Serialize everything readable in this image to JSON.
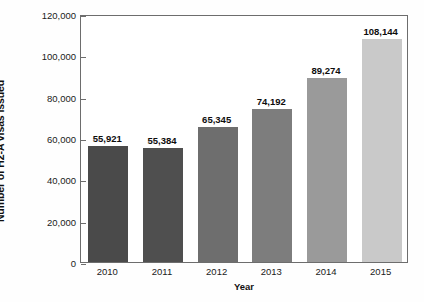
{
  "chart_data": {
    "type": "bar",
    "title": "",
    "xlabel": "Year",
    "ylabel": "Number of H2-A visas issued",
    "categories": [
      "2010",
      "2011",
      "2012",
      "2013",
      "2014",
      "2015"
    ],
    "values": [
      55921,
      55384,
      65345,
      74192,
      89274,
      108144
    ],
    "value_labels": [
      "55,921",
      "55,384",
      "65,345",
      "74,192",
      "89,274",
      "108,144"
    ],
    "bar_colors": [
      "#4a4a4a",
      "#4f4f4f",
      "#6e6e6e",
      "#7d7d7d",
      "#9a9a9a",
      "#c9c9c9"
    ],
    "ylim": [
      0,
      120000
    ],
    "yticks": [
      0,
      20000,
      40000,
      60000,
      80000,
      100000,
      120000
    ],
    "ytick_labels": [
      "0",
      "20,000",
      "40,000",
      "60,000",
      "80,000",
      "100,000",
      "120,000"
    ],
    "grid": false,
    "legend": "none",
    "frame_color": "#6d6d6d"
  }
}
